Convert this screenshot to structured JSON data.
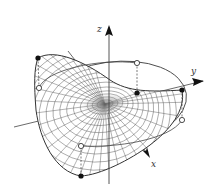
{
  "figure": {
    "axes": {
      "x": {
        "label": "x"
      },
      "y": {
        "label": "y"
      },
      "z": {
        "label": "z"
      }
    },
    "points": {
      "filled": [
        {
          "name": "surface-point-left",
          "cx": 38,
          "cy": 58
        },
        {
          "name": "surface-point-front",
          "cx": 137,
          "cy": 93
        },
        {
          "name": "surface-point-right",
          "cx": 182,
          "cy": 90
        },
        {
          "name": "surface-point-bottom",
          "cx": 81,
          "cy": 176
        }
      ],
      "open": [
        {
          "name": "circle-point-left",
          "cx": 39,
          "cy": 88
        },
        {
          "name": "circle-point-back",
          "cx": 137,
          "cy": 63
        },
        {
          "name": "circle-point-right",
          "cx": 182,
          "cy": 120
        },
        {
          "name": "circle-point-bottom",
          "cx": 81,
          "cy": 146
        }
      ]
    },
    "colors": {
      "line": "#333333",
      "mesh": "#555555",
      "background": "#ffffff"
    }
  }
}
